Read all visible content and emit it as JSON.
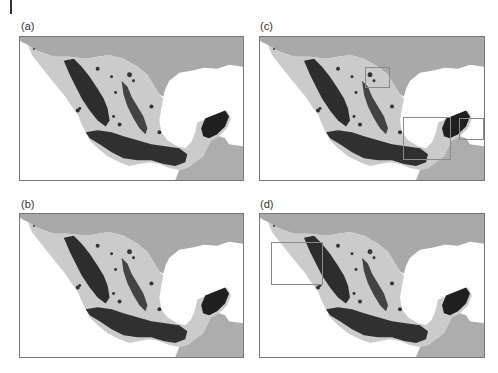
{
  "figure": {
    "colors": {
      "sea": "#ffffff",
      "usa_land": "#a9a9a9",
      "mexico_land": "#cbcbcb",
      "guatemala_land": "#adadad",
      "dense_points": "#1f1f1f",
      "medium_points": "#555555",
      "frame_border": "#777777",
      "highlight_box": "#8a8a8a"
    },
    "panels": [
      {
        "id": "a",
        "label": "(a)",
        "highlight_boxes": []
      },
      {
        "id": "b",
        "label": "(b)",
        "highlight_boxes": []
      },
      {
        "id": "c",
        "label": "(c)",
        "highlight_boxes": [
          {
            "region": "northeast-small"
          },
          {
            "region": "gulf-of-mexico-south"
          },
          {
            "region": "yucatan-peninsula"
          }
        ]
      },
      {
        "id": "d",
        "label": "(d)",
        "highlight_boxes": [
          {
            "region": "baja-california-gulf"
          }
        ]
      }
    ]
  }
}
